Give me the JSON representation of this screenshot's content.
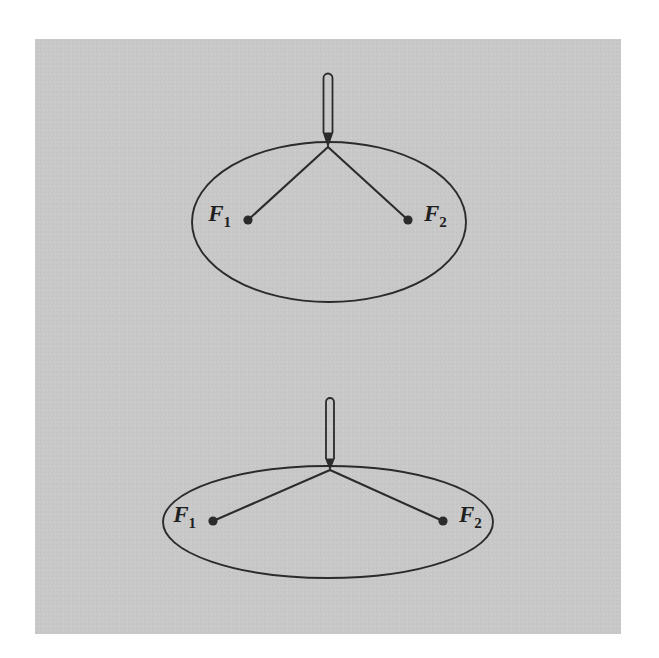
{
  "figure": {
    "kind": "geometric-diagram",
    "canvas": {
      "width": 659,
      "height": 658
    },
    "background_color": "#ffffff",
    "plate": {
      "name": "gray-plate",
      "x": 35,
      "y": 39,
      "width": 586,
      "height": 595,
      "fill_color": "#c8c8c8",
      "grain_color": "#b8b8b8"
    },
    "ink_color": "#2b2b2b",
    "line_width": 1.9
  },
  "panels": [
    {
      "id": "top-panel",
      "name": "ellipse-face-on-view",
      "ellipse": {
        "cx": 329,
        "cy": 222,
        "rx": 137,
        "ry": 80,
        "stroke_color": "#2b2b2b",
        "stroke_width": 1.9,
        "fill": "none"
      },
      "pencil": {
        "name": "pencil-stylus",
        "tip_x": 328,
        "tip_y": 146,
        "top_y": 72,
        "body_top_y": 78,
        "body_bottom_y": 133,
        "half_width": 4.5,
        "stroke_color": "#2b2b2b"
      },
      "foci": [
        {
          "label": "F",
          "sub": "1",
          "dot_x": 248,
          "dot_y": 220,
          "dot_r": 4.6,
          "label_x": 231,
          "label_y": 221,
          "label_anchor": "end"
        },
        {
          "label": "F",
          "sub": "2",
          "dot_x": 408,
          "dot_y": 220,
          "dot_r": 4.6,
          "label_x": 424,
          "label_y": 221,
          "label_anchor": "start"
        }
      ],
      "strings": [
        {
          "name": "string-to-focus-1",
          "x1": 328,
          "y1": 147,
          "x2": 248,
          "y2": 220
        },
        {
          "name": "string-to-focus-2",
          "x1": 328,
          "y1": 147,
          "x2": 408,
          "y2": 220
        }
      ]
    },
    {
      "id": "bottom-panel",
      "name": "ellipse-perspective-view",
      "ellipse": {
        "cx": 328,
        "cy": 522,
        "rx": 165,
        "ry": 56,
        "stroke_color": "#2b2b2b",
        "stroke_width": 1.9,
        "fill": "none"
      },
      "pencil": {
        "name": "pencil-stylus",
        "tip_x": 330,
        "tip_y": 469,
        "top_y": 398,
        "body_top_y": 402,
        "body_bottom_y": 459,
        "half_width": 4.0,
        "stroke_color": "#2b2b2b"
      },
      "foci": [
        {
          "label": "F",
          "sub": "1",
          "dot_x": 213,
          "dot_y": 521,
          "dot_r": 4.6,
          "label_x": 196,
          "label_y": 522,
          "label_anchor": "end"
        },
        {
          "label": "F",
          "sub": "2",
          "dot_x": 443,
          "dot_y": 521,
          "dot_r": 4.6,
          "label_x": 459,
          "label_y": 522,
          "label_anchor": "start"
        }
      ],
      "strings": [
        {
          "name": "string-to-focus-1",
          "x1": 330,
          "y1": 470,
          "x2": 213,
          "y2": 521
        },
        {
          "name": "string-to-focus-2",
          "x1": 330,
          "y1": 470,
          "x2": 443,
          "y2": 521
        }
      ]
    }
  ],
  "labels": {
    "top_focus_1": "F",
    "top_focus_1_sub": "1",
    "top_focus_2": "F",
    "top_focus_2_sub": "2",
    "bottom_focus_1": "F",
    "bottom_focus_1_sub": "1",
    "bottom_focus_2": "F",
    "bottom_focus_2_sub": "2"
  },
  "typography": {
    "label_font_size": 23,
    "label_sub_font_size": 15,
    "label_style": "italic",
    "label_weight": "bold"
  }
}
